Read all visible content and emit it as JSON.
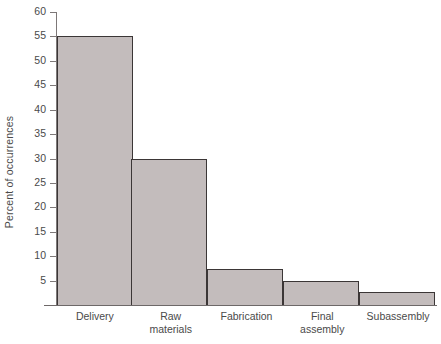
{
  "chart_data": {
    "type": "bar",
    "title": "",
    "xlabel": "",
    "ylabel": "Percent of occurrences",
    "categories": [
      "Delivery",
      "Raw materials",
      "Fabrication",
      "Final assembly",
      "Subassembly"
    ],
    "category_lines": [
      [
        "Delivery"
      ],
      [
        "Raw",
        "materials"
      ],
      [
        "Fabrication"
      ],
      [
        "Final",
        "assembly"
      ],
      [
        "Subassembly"
      ]
    ],
    "values": [
      55,
      30,
      7.3,
      5,
      2.7
    ],
    "ylim": [
      0,
      60
    ],
    "yticks": [
      5,
      10,
      15,
      20,
      25,
      30,
      35,
      40,
      45,
      50,
      55,
      60
    ],
    "ytick_labels": [
      "5",
      "10",
      "15",
      "20",
      "25",
      "30",
      "35",
      "40",
      "45",
      "50",
      "55",
      "60"
    ],
    "grid": false,
    "legend": null,
    "bar_fill_color": "#c3bcbc",
    "bar_edge_color": "#3b3636",
    "axis_color": "#6d6868",
    "text_color": "#4a4a4a",
    "background_color": "#ffffff"
  }
}
